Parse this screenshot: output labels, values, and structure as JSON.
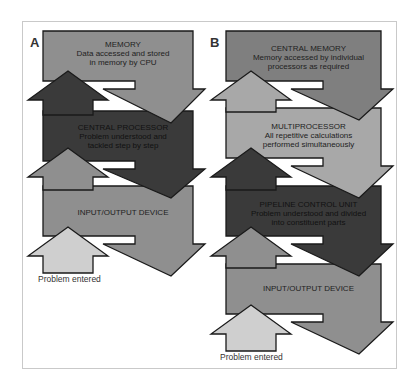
{
  "panels": [
    {
      "id": "A",
      "label": "A",
      "label_pos": [
        30,
        35
      ],
      "origin_x": 43,
      "width": 150,
      "blocks": [
        {
          "title": "MEMORY",
          "lines": [
            "Data accessed and stored",
            "in memory by CPU"
          ],
          "color": "#8f8f8f",
          "top": 31,
          "text_y": 40
        },
        {
          "title": "CENTRAL PROCESSOR",
          "lines": [
            "Problem understood and",
            "tackled step by step"
          ],
          "color": "#3a3a3a",
          "top": 111,
          "text_y": 123
        },
        {
          "title": "INPUT/OUTPUT DEVICE",
          "lines": [],
          "color": "#8f8f8f",
          "top": 186,
          "text_y": 208
        }
      ],
      "up_arrows": [
        {
          "tip_y": 71,
          "color": "#3a3a3a"
        },
        {
          "tip_y": 148,
          "color": "#8f8f8f"
        },
        {
          "tip_y": 227,
          "color": "#cfcfcf"
        }
      ],
      "caption": {
        "text": "Problem entered",
        "pos": [
          38,
          274
        ]
      }
    },
    {
      "id": "B",
      "label": "B",
      "label_pos": [
        210,
        35
      ],
      "origin_x": 226,
      "width": 155,
      "blocks": [
        {
          "title": "CENTRAL MEMORY",
          "lines": [
            "Memory accessed by individual",
            "processors as required"
          ],
          "color": "#7f7f7f",
          "top": 31,
          "text_y": 44
        },
        {
          "title": "MULTIPROCESSOR",
          "lines": [
            "All repetitive calculations",
            "performed simultaneously"
          ],
          "color": "#a8a8a8",
          "top": 108,
          "text_y": 122
        },
        {
          "title": "PIPELINE CONTROL UNIT",
          "lines": [
            "Problem understood and divided",
            "into constituent parts"
          ],
          "color": "#3a3a3a",
          "top": 186,
          "text_y": 200
        },
        {
          "title": "INPUT/OUTPUT DEVICE",
          "lines": [],
          "color": "#8f8f8f",
          "top": 264,
          "text_y": 284
        }
      ],
      "up_arrows": [
        {
          "tip_y": 71,
          "color": "#a8a8a8"
        },
        {
          "tip_y": 148,
          "color": "#3a3a3a"
        },
        {
          "tip_y": 227,
          "color": "#8f8f8f"
        },
        {
          "tip_y": 305,
          "color": "#cfcfcf"
        }
      ],
      "caption": {
        "text": "Problem entered",
        "pos": [
          220,
          352
        ]
      }
    }
  ],
  "colors": {
    "outline": "#1a1a1a",
    "frame": "#c9c9c9",
    "background": "#ffffff"
  }
}
